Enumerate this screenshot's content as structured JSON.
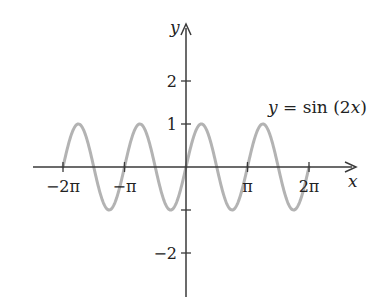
{
  "chart_data": {
    "type": "line",
    "title": "",
    "function_label": "y = sin (2x)",
    "xlabel": "x",
    "ylabel": "y",
    "xlim": [
      -7.4,
      8.6
    ],
    "ylim": [
      -3.0,
      3.3
    ],
    "x_ticks": [
      {
        "value": -6.283,
        "label": "−2π"
      },
      {
        "value": -3.1416,
        "label": "−π"
      },
      {
        "value": 3.1416,
        "label": "π"
      },
      {
        "value": 6.283,
        "label": "2π"
      }
    ],
    "y_ticks": [
      {
        "value": 2,
        "label": "2"
      },
      {
        "value": 1,
        "label": "1"
      },
      {
        "value": -1,
        "label": ""
      },
      {
        "value": -2,
        "label": "−2"
      }
    ],
    "grid": false,
    "legend": null,
    "series": [
      {
        "name": "y = sin (2x)",
        "color": "#b3b3b3",
        "domain": [
          -6.283,
          6.283
        ],
        "x": [
          -6.283,
          -5.498,
          -4.712,
          -3.927,
          -3.1416,
          -2.356,
          -1.571,
          -0.785,
          0,
          0.785,
          1.571,
          2.356,
          3.1416,
          3.927,
          4.712,
          5.498,
          6.283
        ],
        "values": [
          0,
          1,
          0,
          -1,
          0,
          1,
          0,
          -1,
          0,
          1,
          0,
          -1,
          0,
          1,
          0,
          -1,
          0
        ]
      }
    ]
  },
  "colors": {
    "axis": "#3a3a3a",
    "curve": "#b3b3b3",
    "text": "#222222"
  }
}
